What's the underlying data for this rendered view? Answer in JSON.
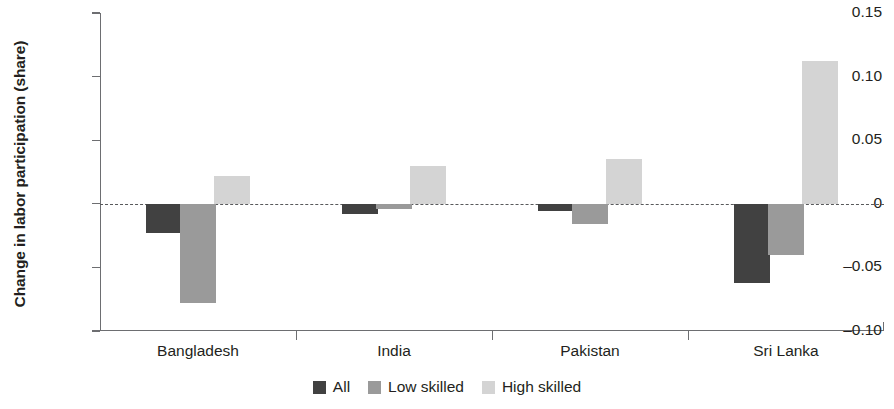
{
  "chart_data": {
    "type": "bar",
    "title": "",
    "subtitle": "",
    "xlabel": "",
    "ylabel": "Change in labor participation (share)",
    "categories": [
      "Bangladesh",
      "India",
      "Pakistan",
      "Sri Lanka"
    ],
    "series": [
      {
        "name": "All",
        "color": "#414141",
        "values": [
          -0.023,
          -0.008,
          -0.006,
          -0.062
        ]
      },
      {
        "name": "Low skilled",
        "color": "#9a9a9a",
        "values": [
          -0.078,
          -0.004,
          -0.016,
          -0.04
        ]
      },
      {
        "name": "High skilled",
        "color": "#d4d4d4",
        "values": [
          0.022,
          0.03,
          0.035,
          0.112
        ]
      }
    ],
    "ylim": [
      -0.1,
      0.15
    ],
    "yticks": [
      0.15,
      0.1,
      0.05,
      0,
      -0.05,
      -0.1
    ],
    "ytick_labels": [
      "0.15",
      "0.10",
      "0.05",
      "0",
      "–0.05",
      "–0.10"
    ],
    "grid": false,
    "zero_line": true,
    "zero_line_style": "dashed",
    "legend_position": "bottom-center",
    "legend": [
      "All",
      "Low skilled",
      "High skilled"
    ],
    "axis_color": "#6d6e71",
    "text_color": "#231f20"
  }
}
